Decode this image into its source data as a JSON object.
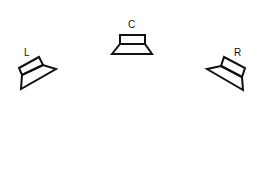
{
  "diagram": {
    "speakers": [
      {
        "id": "left",
        "label": "L"
      },
      {
        "id": "center",
        "label": "C"
      },
      {
        "id": "right",
        "label": "R"
      }
    ],
    "colors": {
      "stroke": "#111111",
      "background": "#ffffff"
    }
  }
}
